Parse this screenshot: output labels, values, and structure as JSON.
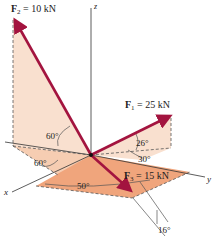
{
  "figure": {
    "axes": {
      "x": "x",
      "y": "y",
      "z": "z"
    },
    "forces": [
      {
        "id": "F1",
        "symbol": "F",
        "sub": "1",
        "eq": " = 25 kN"
      },
      {
        "id": "F2",
        "symbol": "F",
        "sub": "2",
        "eq": " = 10 kN"
      },
      {
        "id": "F3",
        "symbol": "F",
        "sub": "3",
        "eq": " = 15 kN"
      }
    ],
    "angles": {
      "f2_vertical": "60°",
      "f2_horizontal": "60°",
      "f1_elevation": "26°",
      "f1_plane": "30°",
      "f3_plane": "50°",
      "f3_tilt": "16°"
    },
    "colors": {
      "force_arrow": "#a3143f",
      "plane_light": "#f9e0cf",
      "plane_dark": "#f0a57c",
      "axis": "#333333"
    }
  }
}
